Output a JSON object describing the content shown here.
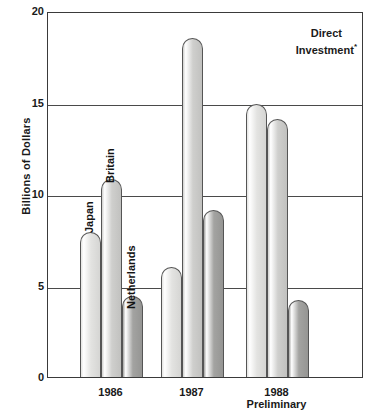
{
  "chart_data": {
    "type": "bar",
    "title": "",
    "annotation": "Direct Investment",
    "annotation_marker": "*",
    "xlabel": "",
    "ylabel": "Billions of Dollars",
    "ylim": [
      0,
      20
    ],
    "yticks": [
      0,
      5,
      10,
      15,
      20
    ],
    "ytick_labels": [
      "0",
      "5",
      "10",
      "15",
      "20"
    ],
    "grid": true,
    "legend_position": "in-bar-labels",
    "categories": [
      "1986",
      "1987",
      "1988"
    ],
    "category_sublabels": [
      "",
      "",
      "Preliminary"
    ],
    "series": [
      {
        "name": "Japan",
        "color": "#e3e3e1",
        "values": [
          7.9,
          6.0,
          14.9
        ]
      },
      {
        "name": "Britain",
        "color": "#cfcfcd",
        "values": [
          10.8,
          18.5,
          14.1
        ]
      },
      {
        "name": "Netherlands",
        "color": "#a3a3a1",
        "values": [
          4.4,
          9.1,
          4.2
        ]
      }
    ],
    "bar_labels_in_chart": [
      "Japan",
      "Britain",
      "Netherlands"
    ]
  }
}
